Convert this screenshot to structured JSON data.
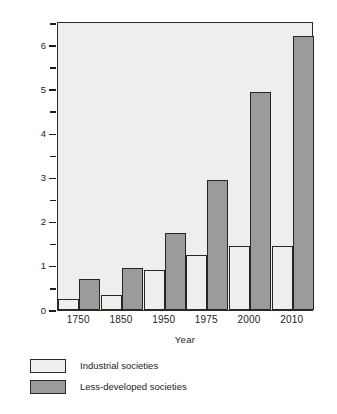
{
  "chart_data": {
    "type": "bar",
    "title": "",
    "xlabel": "Year",
    "ylabel": "Population (in billions)",
    "categories": [
      "1750",
      "1850",
      "1950",
      "1975",
      "2000",
      "2010"
    ],
    "series": [
      {
        "name": "Industrial societies",
        "color": "#efefee",
        "values": [
          0.25,
          0.35,
          0.9,
          1.25,
          1.45,
          1.45
        ]
      },
      {
        "name": "Less-developed societies",
        "color": "#9b9b9b",
        "values": [
          0.7,
          0.95,
          1.75,
          2.95,
          4.95,
          6.2
        ]
      }
    ],
    "ylim": [
      0,
      6.55
    ],
    "yticks": [
      0,
      1,
      2,
      3,
      4,
      5,
      6
    ],
    "ytick_labels": [
      "0",
      "1",
      "2",
      "3",
      "4",
      "5",
      "6"
    ],
    "yminor_ticks": [
      0.5,
      1.5,
      2.5,
      3.5,
      4.5,
      5.5,
      6.5
    ],
    "grid": false,
    "legend_position": "below-left",
    "plot_background": "#eeeeec",
    "axis_color": "#2a2a2a",
    "bar_edge_color": "#262626"
  },
  "legend": {
    "entries": [
      {
        "label": "Industrial societies",
        "swatch": "light"
      },
      {
        "label": "Less-developed societies",
        "swatch": "dark"
      }
    ]
  }
}
